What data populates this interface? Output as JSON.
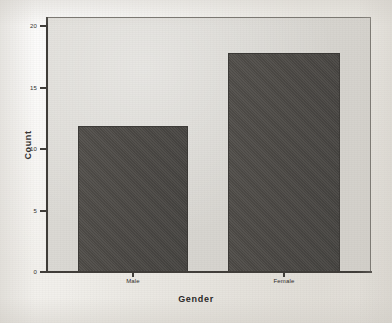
{
  "chart_data": {
    "type": "bar",
    "title": "",
    "subtitle": "",
    "xlabel": "Gender",
    "ylabel": "Count",
    "categories": [
      "Male",
      "Female"
    ],
    "values": [
      12,
      18
    ],
    "series": [
      {
        "name": "Count",
        "values": [
          12,
          18
        ]
      }
    ],
    "ylim": [
      0,
      21
    ],
    "yticks": [
      0,
      5,
      10,
      15,
      20
    ],
    "ytick_labels": [
      "0",
      "5",
      "10",
      "15",
      "20"
    ],
    "xtick_labels": [
      "Male",
      "Female"
    ],
    "grid": false,
    "legend": false,
    "legend_position": "none",
    "bar_color": "#4d4a46",
    "panel_background": "#d9d7d2",
    "figure_background": "#f1efeb",
    "axis_color": "#3f3c38"
  },
  "axes": {
    "y_title": "Count",
    "x_title": "Gender"
  }
}
